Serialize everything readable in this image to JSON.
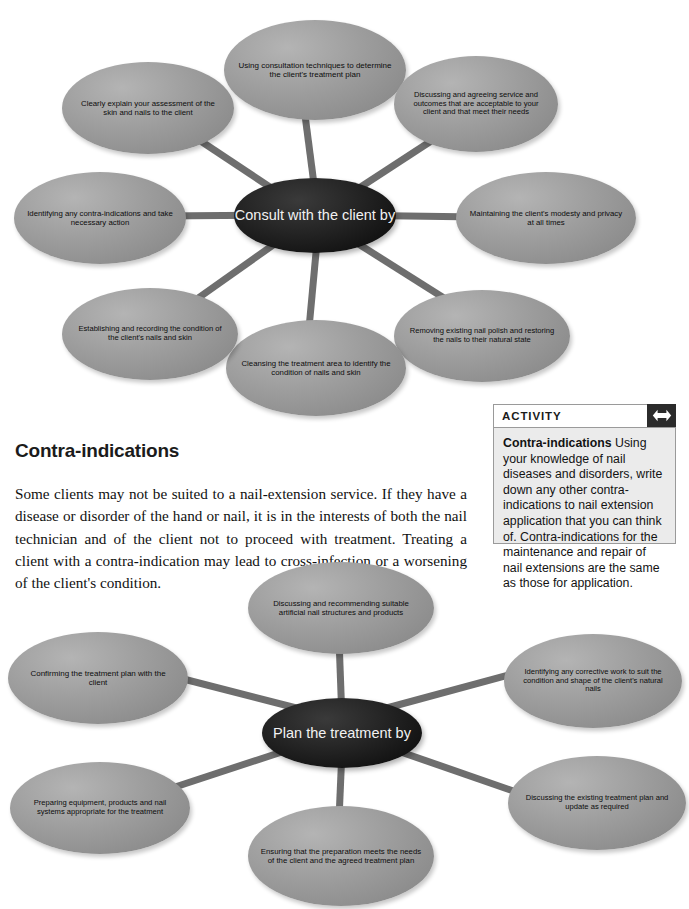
{
  "diagram_top": {
    "center": "Consult with the client by",
    "nodes": [
      "Using consultation techniques to determine the client's treatment plan",
      "Discussing and agreeing service and outcomes that are acceptable to your client and that meet their needs",
      "Maintaining the client's modesty and privacy at all times",
      "Removing existing nail polish and restoring the nails to their natural state",
      "Cleansing the treatment area to identify the condition of nails and skin",
      "Establishing and recording the condition of the client's nails and skin",
      "Identifying any contra-indications and take necessary action",
      "Clearly explain your assessment of the skin and nails to the client"
    ]
  },
  "section": {
    "heading": "Contra-indications",
    "body": "Some clients may not be suited to a nail-extension service. If they have a disease or disorder of the hand or nail, it is in the interests of both the nail technician and of the client not to proceed with treatment. Treating a client with a contra-indication may lead to cross-infection or a worsening of the client's condition."
  },
  "activity": {
    "header": "ACTIVITY",
    "icon": "double-arrow-icon",
    "title": "Contra-indications",
    "body": "Using your knowledge of nail diseases and disorders, write down any other contra-indications to nail extension application that you can think of. Contra-indications for the maintenance and repair of nail extensions are the same as those for application."
  },
  "diagram_bottom": {
    "center": "Plan the treatment by",
    "nodes": [
      "Discussing and recommending suitable artificial nail structures and products",
      "Identifying any corrective work to suit the condition and shape of the client's natural nails",
      "Discussing the existing treatment plan and update as required",
      "Ensuring that the preparation meets the needs of the client and the agreed treatment plan",
      "Preparing equipment, products and nail systems appropriate for the treatment",
      "Confirming the treatment plan with the client"
    ]
  },
  "colors": {
    "node_fill": "#9d9d9d",
    "center_fill": "#141414",
    "spoke": "#6e6e6e",
    "activity_bg": "#ebebeb",
    "activity_icon_bg": "#2b2b2b"
  }
}
